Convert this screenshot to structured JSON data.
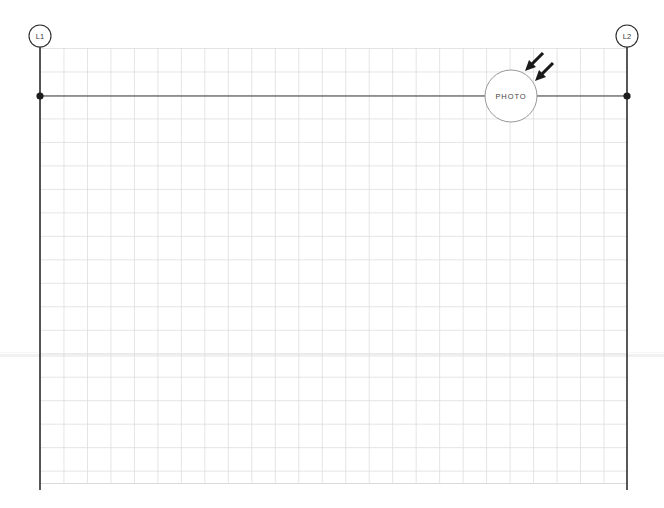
{
  "drawing": {
    "background_color": "#ffffff",
    "width": 664,
    "height": 508
  },
  "grid": {
    "name": "planning-grid",
    "left": 40,
    "top": 48,
    "right": 627,
    "bottom": 483,
    "cell_size": 23.48,
    "columns": 25,
    "rows": 18.5,
    "line_color": "#d9d9d9",
    "line_width": 0.7
  },
  "gridlines": [
    {
      "id": "L1",
      "label": "L1",
      "x": 40,
      "bubble_cy": 36,
      "bubble_r": 11,
      "line_top": 47,
      "line_bottom": 490,
      "color": "#2e2e2e",
      "line_width": 1.6
    },
    {
      "id": "L2",
      "label": "L2",
      "x": 627,
      "bubble_cy": 36,
      "bubble_r": 11,
      "line_top": 47,
      "line_bottom": 490,
      "color": "#2e2e2e",
      "line_width": 1.6
    }
  ],
  "dimension_line": {
    "name": "horizontal-dimension",
    "y": 96,
    "x_start": 40,
    "x_end": 627,
    "color": "#3a3a3a",
    "line_width": 1.1,
    "node_radius": 3.6,
    "node_color": "#1d1d1d"
  },
  "photo_marker": {
    "label": "PHOTO",
    "cx": 511,
    "cy": 96,
    "r": 26,
    "fill": "#ffffff",
    "stroke": "#8c8c8c",
    "stroke_width": 0.9
  },
  "arrows": [
    {
      "name": "view-arrow-1",
      "x1": 542,
      "y1": 52,
      "x2": 526,
      "y2": 68,
      "color": "#1a1a1a",
      "width": 3.2
    },
    {
      "name": "view-arrow-2",
      "x1": 552,
      "y1": 62,
      "x2": 536,
      "y2": 78,
      "color": "#1a1a1a",
      "width": 3.2
    }
  ],
  "artifact_band": {
    "name": "scan-artifact-band",
    "y": 355,
    "x_start": 0,
    "x_end": 664,
    "color": "#efefef",
    "height": 3
  }
}
